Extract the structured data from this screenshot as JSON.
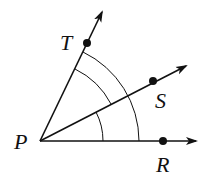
{
  "diagram": {
    "type": "angle-rays",
    "vertex": {
      "label": "P",
      "x": 40,
      "y": 141,
      "label_x": 14,
      "label_y": 149
    },
    "rays": [
      {
        "name": "R",
        "label": "R",
        "dot": [
          163,
          141
        ],
        "tip": [
          196,
          141
        ],
        "label_pos": [
          156,
          172
        ]
      },
      {
        "name": "S",
        "label": "S",
        "dot": [
          153,
          81
        ],
        "tip": [
          186,
          66
        ],
        "label_pos": [
          155,
          108
        ]
      },
      {
        "name": "T",
        "label": "T",
        "dot": [
          87,
          43
        ],
        "tip": [
          102,
          12
        ],
        "label_pos": [
          60,
          50
        ]
      }
    ],
    "arcs": [
      {
        "name": "angle-RPS-arc",
        "radius": 63
      },
      {
        "name": "angle-SPT-arc",
        "radius": 80
      },
      {
        "name": "angle-RPT-arc",
        "radius": 99
      }
    ],
    "colors": {
      "stroke": "#111111",
      "background": "#ffffff"
    }
  }
}
